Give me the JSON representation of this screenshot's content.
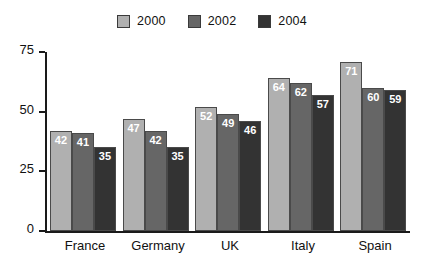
{
  "chart_data": {
    "type": "bar",
    "title": "",
    "subtitle": "",
    "xlabel": "",
    "ylabel": "",
    "categories": [
      "France",
      "Germany",
      "UK",
      "Italy",
      "Spain"
    ],
    "series": [
      {
        "name": "2000",
        "color": "#b0b0b0",
        "values": [
          42,
          47,
          52,
          64,
          71
        ]
      },
      {
        "name": "2002",
        "color": "#666666",
        "values": [
          41,
          42,
          49,
          62,
          60
        ]
      },
      {
        "name": "2004",
        "color": "#333333",
        "values": [
          35,
          35,
          46,
          57,
          59
        ]
      }
    ],
    "ylim": [
      0,
      75
    ],
    "yticks": [
      0,
      25,
      50,
      75
    ],
    "ytick_labels": [
      "0",
      "25",
      "50",
      "75"
    ],
    "grid": false,
    "legend_position": "top-center",
    "data_labels": true
  },
  "legend": {
    "items": [
      {
        "label": "2000",
        "color": "#b0b0b0"
      },
      {
        "label": "2002",
        "color": "#666666"
      },
      {
        "label": "2004",
        "color": "#333333"
      }
    ]
  }
}
